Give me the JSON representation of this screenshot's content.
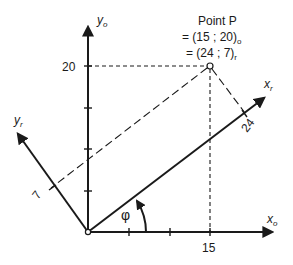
{
  "annotation": {
    "line1": "Point P",
    "line2_prefix": "= (15 ; 20)",
    "line2_sub": "o",
    "line3_prefix": "= (24 ; 7)",
    "line3_sub": "r"
  },
  "axes": {
    "x_o": {
      "base": "x",
      "sub": "o"
    },
    "y_o": {
      "base": "y",
      "sub": "o"
    },
    "x_r": {
      "base": "x",
      "sub": "r"
    },
    "y_r": {
      "base": "y",
      "sub": "r"
    }
  },
  "labels": {
    "y_tick_20": "20",
    "x_tick_15": "15",
    "xr_tick_24": "24",
    "yr_tick_7": "7",
    "angle": "φ"
  },
  "point_p": {
    "o": [
      15,
      20
    ],
    "r": [
      24,
      7
    ]
  },
  "colors": {
    "ink": "#1a1a1a",
    "background": "#ffffff"
  }
}
